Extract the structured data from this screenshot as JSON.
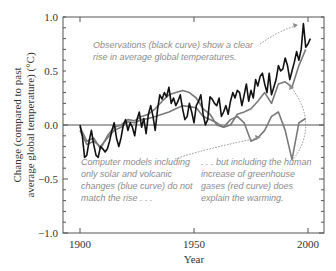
{
  "chart_data": {
    "type": "line",
    "title": "",
    "xlabel": "Year",
    "ylabel_lines": [
      "Change (compared to past",
      "average global temperature) (°C)"
    ],
    "xlim": [
      1892,
      2007
    ],
    "ylim": [
      -1.0,
      1.0
    ],
    "x_ticks": [
      1900,
      1950,
      2000
    ],
    "x_tick_labels": [
      "1900",
      "1950",
      "2000"
    ],
    "y_ticks": [
      1.0,
      0.5,
      0.0,
      -0.5,
      -1.0
    ],
    "y_tick_labels": [
      "1.0",
      "0.5",
      "0.0",
      "−0.5",
      "−1.0"
    ],
    "grid": false,
    "zero_line": true,
    "legend": "none (annotations used)",
    "series": [
      {
        "name": "Observations (black curve)",
        "color": "#111111",
        "x": [
          1900,
          1901,
          1902,
          1903,
          1904,
          1905,
          1906,
          1907,
          1908,
          1909,
          1910,
          1911,
          1912,
          1913,
          1914,
          1915,
          1916,
          1917,
          1918,
          1919,
          1920,
          1921,
          1922,
          1923,
          1924,
          1925,
          1926,
          1927,
          1928,
          1929,
          1930,
          1931,
          1932,
          1933,
          1934,
          1935,
          1936,
          1937,
          1938,
          1939,
          1940,
          1941,
          1942,
          1943,
          1944,
          1945,
          1946,
          1947,
          1948,
          1949,
          1950,
          1951,
          1952,
          1953,
          1954,
          1955,
          1956,
          1957,
          1958,
          1959,
          1960,
          1961,
          1962,
          1963,
          1964,
          1965,
          1966,
          1967,
          1968,
          1969,
          1970,
          1971,
          1972,
          1973,
          1974,
          1975,
          1976,
          1977,
          1978,
          1979,
          1980,
          1981,
          1982,
          1983,
          1984,
          1985,
          1986,
          1987,
          1988,
          1989,
          1990,
          1991,
          1992,
          1993,
          1994,
          1995,
          1996,
          1997,
          1998,
          1999,
          2000,
          2001
        ],
        "values": [
          0.0,
          -0.1,
          -0.3,
          -0.28,
          -0.15,
          -0.05,
          -0.18,
          -0.28,
          -0.3,
          -0.2,
          -0.22,
          -0.25,
          -0.22,
          -0.15,
          -0.05,
          0.02,
          -0.12,
          -0.2,
          -0.12,
          0.0,
          0.05,
          -0.05,
          0.02,
          -0.02,
          -0.1,
          0.05,
          0.12,
          -0.02,
          0.06,
          -0.08,
          0.1,
          0.18,
          0.08,
          -0.05,
          0.14,
          0.28,
          0.24,
          0.3,
          0.26,
          0.35,
          0.2,
          0.25,
          0.18,
          0.22,
          0.28,
          0.15,
          0.05,
          0.08,
          0.2,
          0.12,
          0.02,
          0.18,
          0.22,
          0.28,
          0.1,
          0.0,
          0.05,
          0.26,
          0.24,
          0.2,
          0.18,
          0.25,
          0.08,
          0.12,
          0.18,
          0.1,
          0.22,
          0.3,
          0.25,
          0.32,
          0.3,
          0.18,
          0.28,
          0.38,
          0.22,
          0.32,
          0.25,
          0.42,
          0.36,
          0.45,
          0.48,
          0.38,
          0.3,
          0.48,
          0.28,
          0.35,
          0.42,
          0.55,
          0.5,
          0.52,
          0.62,
          0.55,
          0.42,
          0.5,
          0.58,
          0.68,
          0.6,
          0.7,
          0.94,
          0.72,
          0.75,
          0.8
        ]
      },
      {
        "name": "Model: solar and volcanic only (blue curve)",
        "color": "#7a7a7a",
        "x": [
          1900,
          1903,
          1906,
          1909,
          1912,
          1915,
          1918,
          1921,
          1924,
          1927,
          1930,
          1933,
          1936,
          1939,
          1942,
          1945,
          1948,
          1951,
          1954,
          1957,
          1960,
          1963,
          1966,
          1969,
          1972,
          1975,
          1978,
          1981,
          1984,
          1987,
          1990,
          1993,
          1996,
          1999
        ],
        "values": [
          -0.02,
          -0.15,
          -0.12,
          -0.22,
          -0.1,
          -0.02,
          0.0,
          0.05,
          0.04,
          0.08,
          0.1,
          0.15,
          0.22,
          0.28,
          0.3,
          0.32,
          0.3,
          0.25,
          0.15,
          0.1,
          0.0,
          -0.02,
          0.05,
          0.08,
          0.02,
          -0.15,
          -0.12,
          -0.05,
          0.08,
          0.12,
          -0.05,
          -0.32,
          0.02,
          0.06
        ]
      },
      {
        "name": "Model: including greenhouse gases (red curve)",
        "color": "#7a7a7a",
        "x": [
          1900,
          1903,
          1906,
          1909,
          1912,
          1915,
          1918,
          1921,
          1924,
          1927,
          1930,
          1933,
          1936,
          1939,
          1942,
          1945,
          1948,
          1951,
          1954,
          1957,
          1960,
          1963,
          1966,
          1969,
          1972,
          1975,
          1978,
          1981,
          1984,
          1987,
          1990,
          1993,
          1996,
          1999
        ],
        "values": [
          -0.05,
          -0.18,
          -0.15,
          -0.2,
          -0.12,
          -0.05,
          -0.02,
          0.03,
          0.02,
          0.05,
          0.06,
          0.08,
          0.1,
          0.12,
          0.15,
          0.18,
          0.17,
          0.16,
          0.08,
          0.05,
          0.02,
          -0.02,
          0.0,
          0.1,
          0.12,
          0.15,
          0.22,
          0.3,
          0.2,
          0.38,
          0.4,
          0.35,
          0.55,
          0.7
        ]
      }
    ],
    "annotations": [
      {
        "text": "Observations (black curve) show a clear rise in average global temperatures.",
        "arrow_to": [
          1997,
          0.94
        ]
      },
      {
        "text": "Computer models including only solar and volcanic changes (blue curve) do not match the rise . . .",
        "arrow_to": [
          1967,
          0.02
        ]
      },
      {
        "text": ". . . but including the human increase of greenhouse gases (red curve) does explain the warming.",
        "arrow_to": [
          1992,
          0.48
        ]
      }
    ]
  },
  "axes": {
    "xlabel": "Year",
    "ylabel_line1": "Change (compared to past",
    "ylabel_line2": "average global temperature) (°C)",
    "x_ticks": [
      "1900",
      "1950",
      "2000"
    ],
    "y_ticks": [
      "1.0",
      "0.5",
      "0.0",
      "−0.5",
      "−1.0"
    ]
  },
  "annotations": {
    "obs_line1": "Observations (black curve) show a clear",
    "obs_line2": "rise in average global temperatures.",
    "solar_line1": "Computer models including",
    "solar_line2": "only solar and volcanic",
    "solar_line3": "changes (blue curve) do not",
    "solar_line4": "match the rise . . .",
    "ghg_line1": ". . . but including the human",
    "ghg_line2": "increase of greenhouse",
    "ghg_line3": "gases (red curve) does",
    "ghg_line4": "explain the warming."
  }
}
